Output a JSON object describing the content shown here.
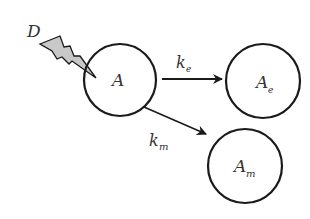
{
  "diagram": {
    "type": "reaction-kinetics",
    "source_label": "D",
    "nodes": [
      {
        "id": "A",
        "label": "A",
        "sub": ""
      },
      {
        "id": "Ae",
        "label": "A",
        "sub": "e"
      },
      {
        "id": "Am",
        "label": "A",
        "sub": "m"
      }
    ],
    "edges": [
      {
        "from": "A",
        "to": "Ae",
        "label": "k",
        "sub": "e"
      },
      {
        "from": "A",
        "to": "Am",
        "label": "k",
        "sub": "m"
      }
    ],
    "colors": {
      "stroke": "#1a1a1a",
      "text": "#333333",
      "bolt_fill": "#c8c8c8"
    }
  }
}
